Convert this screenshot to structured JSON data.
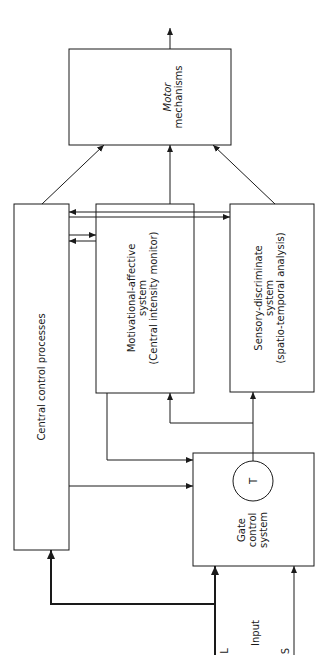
{
  "diagram": {
    "boxes": {
      "motor": {
        "lines": [
          "Motor",
          "mechanisms"
        ]
      },
      "central": {
        "lines": [
          "Central control processes"
        ]
      },
      "motivational": {
        "lines": [
          "Motivational-affective",
          "system",
          "(Central intensity monitor)"
        ]
      },
      "sensory": {
        "lines": [
          "Sensory-discriminate",
          "system",
          "(spatio-temporal analysis)"
        ]
      },
      "gate": {
        "lines": [
          "Gate",
          "control",
          "system"
        ]
      }
    },
    "t_cell": {
      "label": "T"
    },
    "inputs": {
      "large": "L",
      "label": "Input",
      "small": "S"
    },
    "colors": {
      "line": "#1a1a1a",
      "background": "#ffffff"
    }
  }
}
